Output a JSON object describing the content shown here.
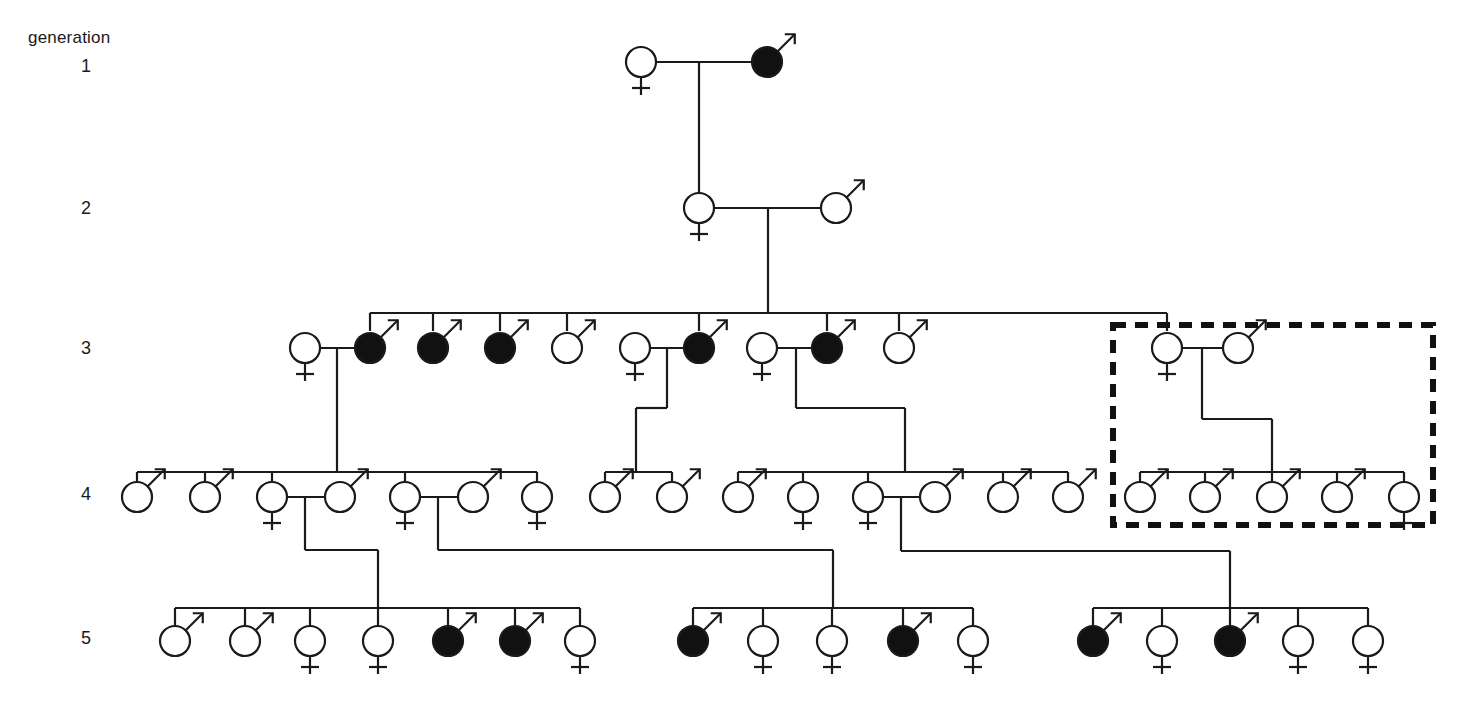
{
  "figure": {
    "kind": "pedigree-chart",
    "title_label": "generation",
    "generation_labels": [
      "1",
      "2",
      "3",
      "4",
      "5"
    ],
    "stroke_color": "#1a1a1a",
    "affected_fill": "#111111",
    "unaffected_fill": "#ffffff",
    "background": "#ffffff",
    "symbol_radius": 15,
    "line_width": 2.2,
    "highlight_box": {
      "name": "dashed-highlight-box",
      "x": 1113,
      "y": 325,
      "width": 320,
      "height": 200,
      "style": "dashed",
      "stroke": "#111111",
      "stroke_width": 6,
      "dash": "13 9"
    },
    "legend_notes": {
      "male_glyph": "circle with diagonal arrow (Mars)",
      "female_glyph": "circle with cross below (Venus)",
      "affected": "filled black symbol",
      "unaffected": "open white symbol"
    }
  },
  "generations": {
    "g1": {
      "y": 62,
      "individuals": [
        {
          "id": "I-1",
          "sex": "female",
          "affected": false,
          "x": 641,
          "y": 62
        },
        {
          "id": "I-2",
          "sex": "male",
          "affected": true,
          "x": 767,
          "y": 62
        }
      ]
    },
    "g2": {
      "y": 208,
      "individuals": [
        {
          "id": "II-1",
          "sex": "female",
          "affected": false,
          "x": 699,
          "y": 208
        },
        {
          "id": "II-2",
          "sex": "male",
          "affected": false,
          "x": 836,
          "y": 208
        }
      ]
    },
    "g3": {
      "y": 348,
      "individuals": [
        {
          "id": "III-s1",
          "sex": "female",
          "affected": false,
          "x": 305,
          "y": 348,
          "role": "spouse"
        },
        {
          "id": "III-1",
          "sex": "male",
          "affected": true,
          "x": 370,
          "y": 348,
          "role": "sib"
        },
        {
          "id": "III-2",
          "sex": "male",
          "affected": true,
          "x": 433,
          "y": 348,
          "role": "sib"
        },
        {
          "id": "III-3",
          "sex": "male",
          "affected": true,
          "x": 500,
          "y": 348,
          "role": "sib"
        },
        {
          "id": "III-4",
          "sex": "male",
          "affected": false,
          "x": 567,
          "y": 348,
          "role": "sib"
        },
        {
          "id": "III-s2",
          "sex": "female",
          "affected": false,
          "x": 635,
          "y": 348,
          "role": "spouse"
        },
        {
          "id": "III-5",
          "sex": "male",
          "affected": true,
          "x": 699,
          "y": 348,
          "role": "sib"
        },
        {
          "id": "III-s3",
          "sex": "female",
          "affected": false,
          "x": 762,
          "y": 348,
          "role": "spouse"
        },
        {
          "id": "III-6",
          "sex": "male",
          "affected": true,
          "x": 827,
          "y": 348,
          "role": "sib"
        },
        {
          "id": "III-7",
          "sex": "male",
          "affected": false,
          "x": 899,
          "y": 348,
          "role": "sib"
        },
        {
          "id": "III-8",
          "sex": "female",
          "affected": false,
          "x": 1167,
          "y": 348,
          "role": "sib"
        },
        {
          "id": "III-s4",
          "sex": "male",
          "affected": false,
          "x": 1238,
          "y": 348,
          "role": "spouse"
        }
      ],
      "sibship_bar": {
        "y": 313,
        "x1": 370,
        "x2": 1167
      },
      "sib_x": [
        370,
        433,
        500,
        567,
        699,
        827,
        899,
        1167
      ]
    },
    "g4": {
      "y": 497,
      "individuals": [
        {
          "id": "IV-1",
          "sex": "male",
          "affected": false,
          "x": 137,
          "y": 497
        },
        {
          "id": "IV-2",
          "sex": "male",
          "affected": false,
          "x": 205,
          "y": 497
        },
        {
          "id": "IV-3",
          "sex": "female",
          "affected": false,
          "x": 272,
          "y": 497
        },
        {
          "id": "IV-s1",
          "sex": "male",
          "affected": false,
          "x": 340,
          "y": 497,
          "role": "spouse"
        },
        {
          "id": "IV-4",
          "sex": "female",
          "affected": false,
          "x": 405,
          "y": 497
        },
        {
          "id": "IV-s2",
          "sex": "male",
          "affected": false,
          "x": 473,
          "y": 497,
          "role": "spouse"
        },
        {
          "id": "IV-5",
          "sex": "female",
          "affected": false,
          "x": 537,
          "y": 497
        },
        {
          "id": "IV-6",
          "sex": "male",
          "affected": false,
          "x": 605,
          "y": 497
        },
        {
          "id": "IV-7",
          "sex": "male",
          "affected": false,
          "x": 672,
          "y": 497
        },
        {
          "id": "IV-8",
          "sex": "male",
          "affected": false,
          "x": 738,
          "y": 497
        },
        {
          "id": "IV-9",
          "sex": "female",
          "affected": false,
          "x": 803,
          "y": 497
        },
        {
          "id": "IV-10",
          "sex": "female",
          "affected": false,
          "x": 868,
          "y": 497
        },
        {
          "id": "IV-s3",
          "sex": "male",
          "affected": false,
          "x": 935,
          "y": 497,
          "role": "spouse"
        },
        {
          "id": "IV-11",
          "sex": "male",
          "affected": false,
          "x": 1003,
          "y": 497
        },
        {
          "id": "IV-12",
          "sex": "male",
          "affected": false,
          "x": 1068,
          "y": 497
        },
        {
          "id": "IV-13",
          "sex": "male",
          "affected": false,
          "x": 1140,
          "y": 497,
          "in_box": true
        },
        {
          "id": "IV-14",
          "sex": "male",
          "affected": false,
          "x": 1205,
          "y": 497,
          "in_box": true
        },
        {
          "id": "IV-15",
          "sex": "male",
          "affected": false,
          "x": 1272,
          "y": 497,
          "in_box": true
        },
        {
          "id": "IV-16",
          "sex": "male",
          "affected": false,
          "x": 1337,
          "y": 497,
          "in_box": true
        },
        {
          "id": "IV-17",
          "sex": "female",
          "affected": false,
          "x": 1404,
          "y": 497,
          "in_box": true
        }
      ],
      "sibship_bars": [
        {
          "y": 472,
          "x1": 137,
          "x2": 537,
          "children_x": [
            137,
            205,
            272,
            405,
            537
          ]
        },
        {
          "y": 472,
          "x1": 605,
          "x2": 672,
          "children_x": [
            605,
            672
          ]
        },
        {
          "y": 472,
          "x1": 738,
          "x2": 1068,
          "children_x": [
            738,
            803,
            868,
            1003,
            1068
          ]
        },
        {
          "y": 472,
          "x1": 1140,
          "x2": 1404,
          "children_x": [
            1140,
            1205,
            1272,
            1337,
            1404
          ]
        }
      ]
    },
    "g5": {
      "y": 641,
      "individuals": [
        {
          "id": "V-1",
          "sex": "male",
          "affected": false,
          "x": 175,
          "y": 641
        },
        {
          "id": "V-2",
          "sex": "male",
          "affected": false,
          "x": 245,
          "y": 641
        },
        {
          "id": "V-3",
          "sex": "female",
          "affected": false,
          "x": 310,
          "y": 641
        },
        {
          "id": "V-4",
          "sex": "female",
          "affected": false,
          "x": 378,
          "y": 641
        },
        {
          "id": "V-5",
          "sex": "male",
          "affected": true,
          "x": 448,
          "y": 641
        },
        {
          "id": "V-6",
          "sex": "male",
          "affected": true,
          "x": 515,
          "y": 641
        },
        {
          "id": "V-7",
          "sex": "female",
          "affected": false,
          "x": 580,
          "y": 641
        },
        {
          "id": "V-8",
          "sex": "male",
          "affected": true,
          "x": 693,
          "y": 641
        },
        {
          "id": "V-9",
          "sex": "female",
          "affected": false,
          "x": 763,
          "y": 641
        },
        {
          "id": "V-10",
          "sex": "female",
          "affected": false,
          "x": 832,
          "y": 641
        },
        {
          "id": "V-11",
          "sex": "male",
          "affected": true,
          "x": 903,
          "y": 641
        },
        {
          "id": "V-12",
          "sex": "female",
          "affected": false,
          "x": 973,
          "y": 641
        },
        {
          "id": "V-13",
          "sex": "male",
          "affected": true,
          "x": 1093,
          "y": 641
        },
        {
          "id": "V-14",
          "sex": "female",
          "affected": false,
          "x": 1162,
          "y": 641
        },
        {
          "id": "V-15",
          "sex": "male",
          "affected": true,
          "x": 1230,
          "y": 641
        },
        {
          "id": "V-16",
          "sex": "female",
          "affected": false,
          "x": 1298,
          "y": 641
        },
        {
          "id": "V-17",
          "sex": "female",
          "affected": false,
          "x": 1368,
          "y": 641
        }
      ],
      "sibship_bars": [
        {
          "y": 608,
          "x1": 175,
          "x2": 580,
          "children_x": [
            175,
            245,
            310,
            378,
            448,
            515,
            580
          ]
        },
        {
          "y": 608,
          "x1": 693,
          "x2": 973,
          "children_x": [
            693,
            763,
            832,
            903,
            973
          ]
        },
        {
          "y": 608,
          "x1": 1093,
          "x2": 1368,
          "children_x": [
            1093,
            1162,
            1230,
            1298,
            1368
          ]
        }
      ]
    }
  },
  "matings": [
    {
      "name": "mating-g1",
      "left_x": 641,
      "right_x": 767,
      "y": 62,
      "drop_x": 699,
      "drop_to_y": 208
    },
    {
      "name": "mating-g2",
      "left_x": 699,
      "right_x": 836,
      "y": 208,
      "drop_x": 768,
      "drop_to_y": 313
    },
    {
      "name": "mating-g3-a",
      "left_x": 305,
      "right_x": 370,
      "y": 348,
      "drop_x": 337,
      "drop_to_y": 472,
      "elbow": null
    },
    {
      "name": "mating-g3-b",
      "left_x": 635,
      "right_x": 699,
      "y": 348,
      "drop_x": 667,
      "mid_y": 408,
      "elbow_x": 636,
      "drop_to_y": 472
    },
    {
      "name": "mating-g3-c",
      "left_x": 762,
      "right_x": 827,
      "y": 348,
      "drop_x": 796,
      "mid_y": 408,
      "elbow_x": 905,
      "drop_to_y": 472
    },
    {
      "name": "mating-g3-d",
      "left_x": 1167,
      "right_x": 1238,
      "y": 348,
      "drop_x": 1202,
      "mid_y": 419,
      "elbow_x": 1272,
      "drop_to_y": 472
    },
    {
      "name": "mating-g4-a",
      "left_x": 272,
      "right_x": 340,
      "y": 497,
      "drop_x": 305,
      "mid_y": 550,
      "elbow_x": 378,
      "drop_to_y": 608
    },
    {
      "name": "mating-g4-b",
      "left_x": 405,
      "right_x": 473,
      "y": 497,
      "drop_x": 438,
      "mid_y": 550,
      "elbow_x": 833,
      "drop_to_y": 608
    },
    {
      "name": "mating-g4-c",
      "left_x": 868,
      "right_x": 935,
      "y": 497,
      "drop_x": 901,
      "mid_y": 551,
      "elbow_x": 1230,
      "drop_to_y": 608
    }
  ],
  "counts": {
    "total_individuals": 58,
    "affected_total": 12,
    "affected_by_generation": {
      "1": 1,
      "2": 0,
      "3": 5,
      "4": 0,
      "5": 6
    },
    "generation_sizes": {
      "1": 2,
      "2": 2,
      "3": 12,
      "4": 20,
      "5": 17
    }
  }
}
